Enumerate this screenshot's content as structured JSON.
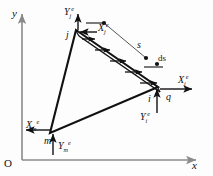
{
  "figure": {
    "type": "mechanics-diagram",
    "background_color": "#fdfdfd",
    "line_color": "#111111",
    "axis_color": "#8a8a8a"
  },
  "axes": {
    "x_label": "x",
    "y_label": "y",
    "origin_label": "O"
  },
  "nodes": [
    {
      "id": "j",
      "label": "j",
      "x": 76,
      "y": 30
    },
    {
      "id": "i",
      "label": "i",
      "x": 158,
      "y": 87
    },
    {
      "id": "m",
      "label": "m",
      "x": 50,
      "y": 133
    }
  ],
  "node_forces": [
    {
      "name": "Xj",
      "base": "X",
      "sub": "j",
      "sup": "e",
      "direction": "left"
    },
    {
      "name": "Yj",
      "base": "Y",
      "sub": "j",
      "sup": "e",
      "direction": "up"
    },
    {
      "name": "Xi",
      "base": "X",
      "sub": "i",
      "sup": "e",
      "direction": "right"
    },
    {
      "name": "Yi",
      "base": "Y",
      "sub": "i",
      "sup": "e",
      "direction": "up"
    },
    {
      "name": "Xm",
      "base": "X",
      "sub": "m",
      "sup": "e",
      "direction": "left"
    },
    {
      "name": "Ym",
      "base": "Y",
      "sub": "m",
      "sup": "e",
      "direction": "up"
    }
  ],
  "load": {
    "symbol": "q",
    "arc_length_symbol": "s",
    "differential_symbol": "ds",
    "edge": "j-i",
    "arrow_count": 5,
    "arrow_direction": "right"
  },
  "labels": {
    "q": "q",
    "s": "s",
    "ds": "ds",
    "x": "x",
    "y": "y",
    "O": "O",
    "i": "i",
    "j": "j",
    "m": "m",
    "X": "X",
    "Y": "Y",
    "sup_e": "e"
  }
}
